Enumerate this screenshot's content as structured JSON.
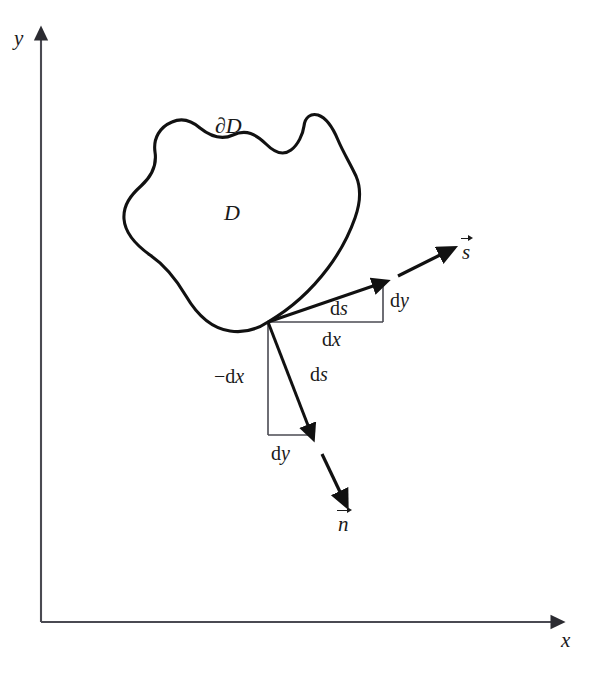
{
  "figure": {
    "kind": "vector-calculus-diagram",
    "background_color": "#ffffff",
    "ink_color": "#1a1a1a",
    "axis_color": "#4a4a52"
  },
  "axes": {
    "y_label": "y",
    "x_label": "x",
    "origin": {
      "x": 41,
      "y": 622
    },
    "y_top": {
      "x": 41,
      "y": 30
    },
    "x_right": {
      "x": 562,
      "y": 622
    }
  },
  "region": {
    "interior_label": "D",
    "boundary_label": "∂D"
  },
  "tangent_triangle": {
    "hypotenuse_label": "ds",
    "vertical_label": "dy",
    "horizontal_label": "dx",
    "vertex": {
      "x": 268,
      "y": 322
    },
    "corner": {
      "x": 383,
      "y": 322
    },
    "tip": {
      "x": 383,
      "y": 282
    }
  },
  "normal_triangle": {
    "hypotenuse_label": "ds",
    "vertical_label": "−dx",
    "horizontal_label": "dy",
    "vertex": {
      "x": 268,
      "y": 322
    },
    "corner": {
      "x": 268,
      "y": 435
    },
    "tip": {
      "x": 312,
      "y": 435
    }
  },
  "vectors": {
    "tangent": {
      "label": "s",
      "accent": "right-arrow-overbar",
      "from": {
        "x": 398,
        "y": 276
      },
      "to": {
        "x": 449,
        "y": 251
      }
    },
    "normal": {
      "label": "n",
      "accent": "right-arrow-overbar",
      "from": {
        "x": 322,
        "y": 454
      },
      "to": {
        "x": 346,
        "y": 503
      }
    }
  },
  "labels": {
    "y_axis": "y",
    "x_axis": "x",
    "region_D": "D",
    "boundary_dD": "∂D",
    "ds_tangent": "ds",
    "dy_tangent": "dy",
    "dx_tangent": "dx",
    "ds_normal": "ds",
    "neg_dx_normal": "−dx",
    "dy_normal": "dy",
    "vec_s": "s",
    "vec_n": "n"
  }
}
